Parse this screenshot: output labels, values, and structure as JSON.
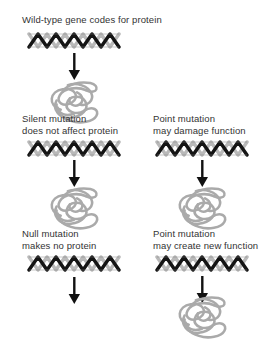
{
  "figure": {
    "title": "Wild-type gene codes for protein",
    "background_color": "#ffffff",
    "text_color": "#333333",
    "dna_color": "#1a1a1a",
    "dna_back_color": "#b9b9b9",
    "protein_color": "#aaaaaa",
    "arrow_color": "#111111"
  },
  "branches": {
    "wildtype": {
      "label_line1": "Wild-type gene codes for protein",
      "label_line2": "",
      "dna_icon": "dna-double-helix-icon",
      "arrow_icon": "down-arrow-icon",
      "protein_icon": "protein-coil-icon",
      "produces_protein": "yes"
    },
    "silent": {
      "label_line1": "Silent mutation",
      "label_line2": "does not affect protein",
      "dna_icon": "dna-double-helix-icon",
      "arrow_icon": "down-arrow-icon",
      "protein_icon": "protein-coil-icon",
      "produces_protein": "yes"
    },
    "point_damage": {
      "label_line1": "Point mutation",
      "label_line2": "may damage function",
      "dna_icon": "dna-double-helix-icon",
      "arrow_icon": "down-arrow-icon",
      "protein_icon": "protein-coil-icon",
      "produces_protein": "yes"
    },
    "null": {
      "label_line1": "Null mutation",
      "label_line2": "makes no protein",
      "dna_icon": "dna-double-helix-icon",
      "arrow_icon": "down-arrow-icon",
      "protein_icon": "",
      "produces_protein": "no"
    },
    "point_new": {
      "label_line1": "Point mutation",
      "label_line2": "may create new function",
      "dna_icon": "dna-double-helix-icon",
      "arrow_icon": "down-arrow-icon",
      "protein_icon": "protein-coil-icon",
      "produces_protein": "yes"
    }
  }
}
